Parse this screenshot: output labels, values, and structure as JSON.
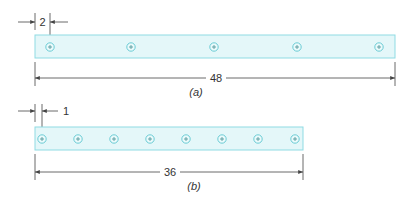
{
  "figure": {
    "strip_color": "#dff6f8",
    "strip_border": "#8fdbe3",
    "hole_color": "#5cc6d0",
    "line_color": "#444444",
    "panel_a": {
      "caption": "(a)",
      "edge_offset_label": "2",
      "length_label": "48",
      "hole_count": 5
    },
    "panel_b": {
      "caption": "(b)",
      "edge_offset_label": "1",
      "length_label": "36",
      "hole_count": 8
    }
  }
}
